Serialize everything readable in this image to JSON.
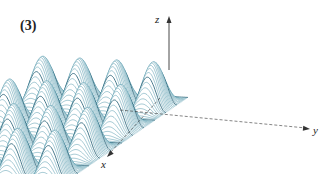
{
  "figure": {
    "panel_label": "(3)",
    "axes": {
      "x": "x",
      "y": "y",
      "z": "z"
    },
    "colors": {
      "line": "#3a8aa0",
      "dark": "#1f5c72",
      "axis": "#333333"
    }
  }
}
